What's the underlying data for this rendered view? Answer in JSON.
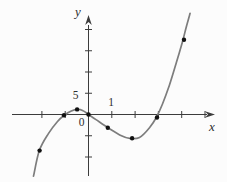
{
  "colors": {
    "curve": "#7d7d7d",
    "axis": "#3c3c3c",
    "point": "#111111",
    "label": "#2e2e2e",
    "background": "#fcfcfc"
  },
  "chart_data": {
    "type": "line",
    "title": "",
    "xlabel": "x",
    "ylabel": "y",
    "origin_label": "0",
    "x_tick_label": "1",
    "y_tick_label": "5",
    "labeled_x_tick": 1,
    "labeled_y_tick": 5,
    "x_ticks": [
      -2,
      -1,
      1,
      2,
      3,
      4,
      5
    ],
    "y_ticks": [
      -10,
      -5,
      5,
      10,
      15,
      20
    ],
    "xlim": [
      -3.3,
      5.5
    ],
    "ylim": [
      -14.5,
      24
    ],
    "grid": false,
    "legend": false,
    "curve_points": [
      [
        -2.36,
        -14.5
      ],
      [
        -2.11,
        -8.5
      ],
      [
        -1.72,
        -4.5
      ],
      [
        -1.34,
        -1.7
      ],
      [
        -1.04,
        -0.2
      ],
      [
        -0.74,
        0.8
      ],
      [
        -0.49,
        1.2
      ],
      [
        -0.23,
        0.9
      ],
      [
        0,
        0
      ],
      [
        0.32,
        -1.2
      ],
      [
        0.83,
        -3.1
      ],
      [
        1.34,
        -4.8
      ],
      [
        1.77,
        -5.6
      ],
      [
        2.19,
        -5.4
      ],
      [
        2.62,
        -3.1
      ],
      [
        2.91,
        -0.7
      ],
      [
        3.17,
        2.4
      ],
      [
        3.47,
        6.9
      ],
      [
        3.77,
        12.2
      ],
      [
        4.02,
        16.9
      ],
      [
        4.23,
        21.3
      ],
      [
        4.36,
        23.8
      ]
    ],
    "marked_points": [
      [
        -2.1,
        -8.5
      ],
      [
        -1.05,
        -0.2
      ],
      [
        -0.49,
        1.2
      ],
      [
        0,
        0
      ],
      [
        0.83,
        -3.1
      ],
      [
        1.87,
        -5.6
      ],
      [
        2.94,
        -0.7
      ],
      [
        4.1,
        17.6
      ]
    ]
  }
}
